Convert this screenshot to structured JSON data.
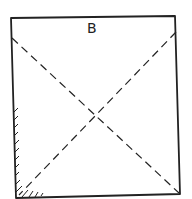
{
  "diagram": {
    "type": "square with dashed diagonals",
    "label": "B",
    "stroke_color": "#222222",
    "features": [
      "solid square outline",
      "two dashed diagonals crossing at center",
      "hatching along lower-left edge"
    ]
  }
}
